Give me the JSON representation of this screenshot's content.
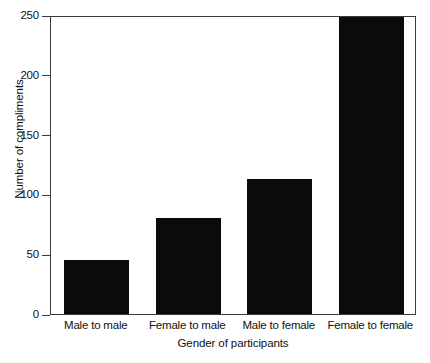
{
  "chart_data": {
    "type": "bar",
    "title": "",
    "xlabel": "Gender of participants",
    "ylabel": "Number of compliments",
    "categories": [
      "Male to male",
      "Female to male",
      "Male to female",
      "Female to female"
    ],
    "values": [
      45,
      80,
      113,
      248
    ],
    "ylim": [
      0,
      250
    ],
    "yticks": [
      0,
      50,
      100,
      150,
      200,
      250
    ],
    "ytick_labels": [
      "0",
      "50",
      "100",
      "150",
      "200",
      "250"
    ],
    "grid": false,
    "legend": "none",
    "bar_color": "#0b0b0b",
    "axis_color": "#3a3a3a",
    "background": "#ffffff"
  }
}
